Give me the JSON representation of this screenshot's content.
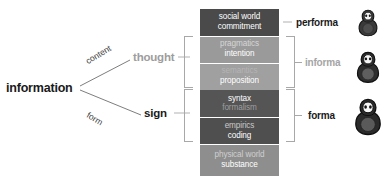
{
  "diagram": {
    "root": {
      "label": "information"
    },
    "branches": [
      {
        "edge_label": "content",
        "node_label": "thought",
        "color": "#9d9d9d"
      },
      {
        "edge_label": "form",
        "node_label": "sign",
        "color": "#1a1a1a"
      }
    ],
    "stack": {
      "bands": [
        {
          "line1": "social world",
          "line2": "commitment",
          "fill": "#4a4a4a",
          "text1": "#ffffff",
          "text2": "#ffffff",
          "height": 27
        },
        {
          "line1": "pragmatics",
          "line2": "intention",
          "fill": "#9a9a9a",
          "text1": "#d6d6d6",
          "text2": "#ffffff",
          "height": 26
        },
        {
          "line1": "semantics",
          "line2": "proposition",
          "fill": "#a0a0a0",
          "text1": "#b4b4b4",
          "text2": "#ffffff",
          "height": 26
        },
        {
          "line1": "syntax",
          "line2": "formalism",
          "fill": "#555555",
          "text1": "#ffffff",
          "text2": "#9e9e9e",
          "height": 27
        },
        {
          "line1": "empirics",
          "line2": "coding",
          "fill": "#4f4f4f",
          "text1": "#c9c9c9",
          "text2": "#ffffff",
          "height": 26
        },
        {
          "line1": "physical world",
          "line2": "substance",
          "fill": "#8e8e8e",
          "text1": "#cfcfcf",
          "text2": "#ffffff",
          "height": 31
        }
      ]
    },
    "right_labels": [
      {
        "label": "performa",
        "color": "#1a1a1a"
      },
      {
        "label": "informa",
        "color": "#a5a5a5"
      },
      {
        "label": "forma",
        "color": "#1a1a1a"
      }
    ],
    "dolls": [
      {
        "name": "matryoshka-performa",
        "size": "small"
      },
      {
        "name": "matryoshka-informa",
        "size": "medium"
      },
      {
        "name": "matryoshka-forma",
        "size": "large"
      }
    ],
    "colors": {
      "bracket": "#a8a8a8",
      "connector": "#6e6e6e",
      "doll_dark": "#2b2b2b",
      "doll_body": "#5e5e5e",
      "doll_face": "#f2f2f2"
    }
  }
}
